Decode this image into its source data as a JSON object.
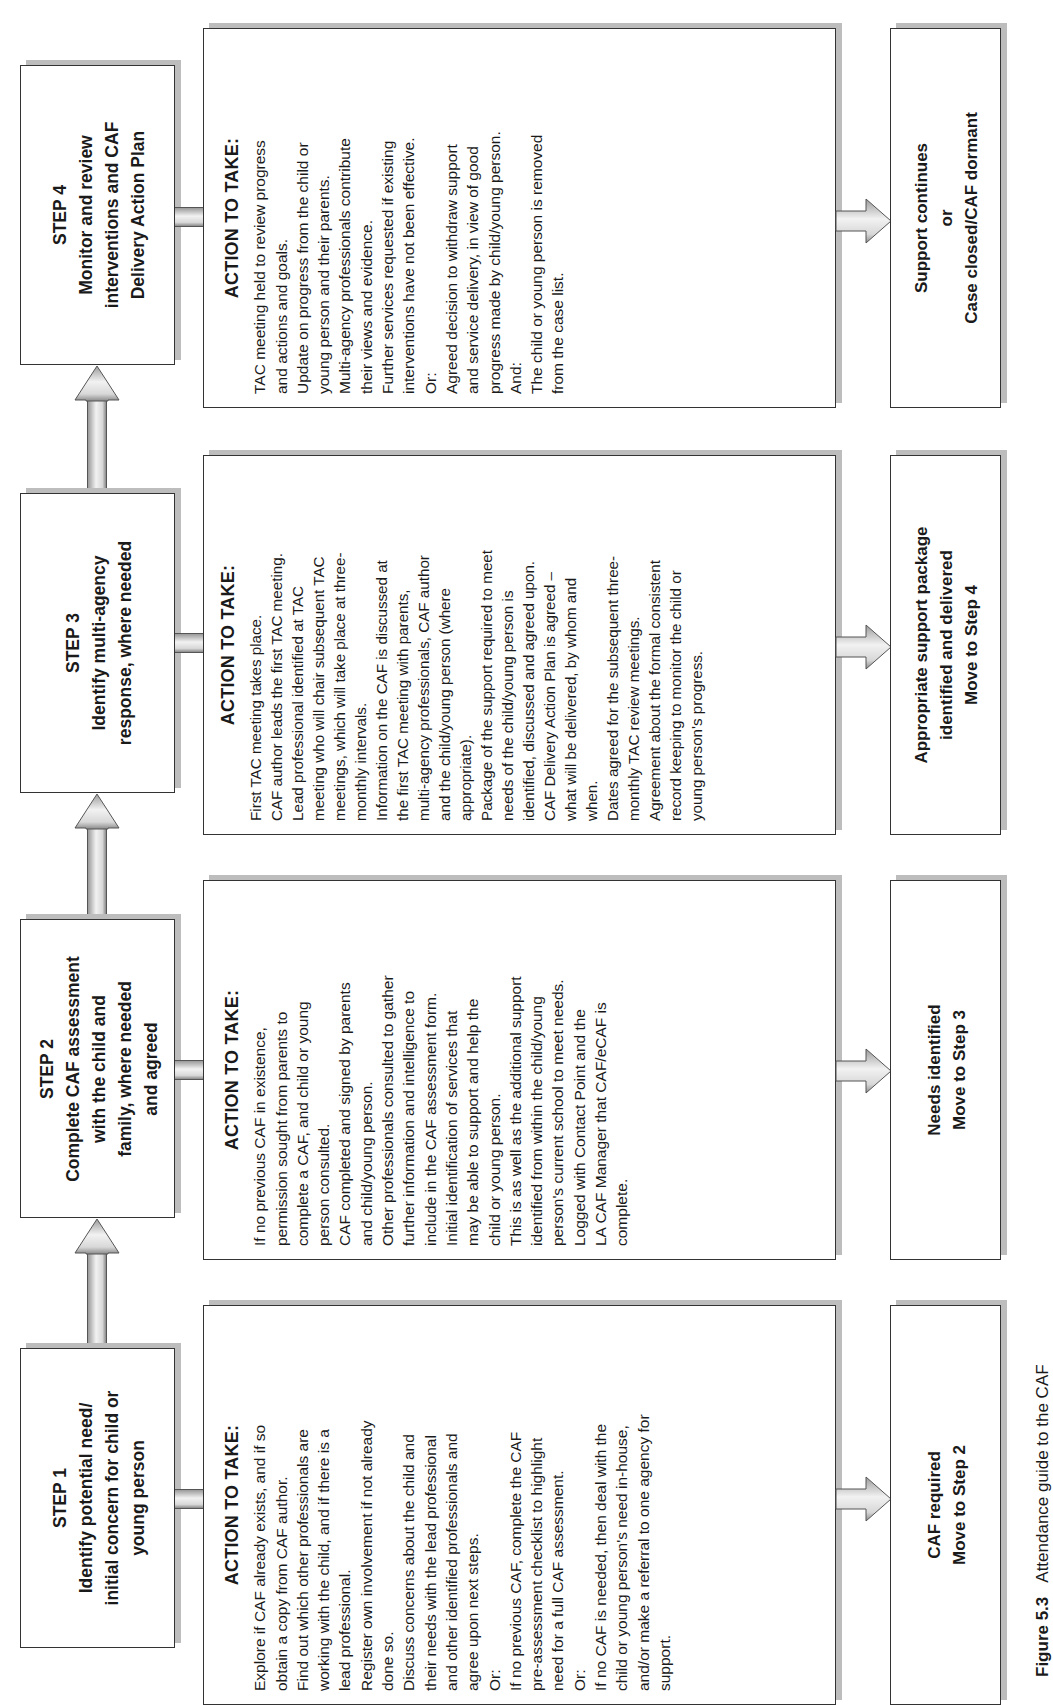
{
  "figure": {
    "caption_label": "Figure 5.3",
    "caption_text": "Attendance guide to the CAF"
  },
  "steps": [
    {
      "id": "step1",
      "title": "STEP 1",
      "lines": [
        "Identify potential need/",
        "initial concern for child or",
        "young person"
      ],
      "action_header": "ACTION TO TAKE:",
      "action_lines": [
        "Explore if CAF already exists,  and if so",
        "obtain a copy from CAF author.",
        "Find out which other professionals are",
        "working with the child,  and if there is a",
        "lead professional.",
        "Register own involvement if not already",
        "done so.",
        "Discuss concerns about the child and",
        "their needs with the lead professional",
        "and other identified professionals and",
        "agree upon next steps.",
        "Or:",
        "If no previous CAF, complete the CAF",
        "pre-assessment checklist to highlight",
        "need for a full CAF assessment.",
        "Or:",
        "If no CAF is needed, then deal with the",
        "child or young person's need in-house,",
        "and/or make a referral to one agency for",
        "support."
      ],
      "outcome_lines": [
        "CAF required",
        "Move to Step 2"
      ]
    },
    {
      "id": "step2",
      "title": "STEP 2",
      "lines": [
        "Complete CAF assessment",
        "with the child and",
        "family, where needed",
        "and agreed"
      ],
      "action_header": "ACTION TO TAKE:",
      "action_lines": [
        "If no previous CAF in existence,",
        "permission sought from parents to",
        "complete a CAF, and child or young",
        "person consulted.",
        "CAF completed and signed by parents",
        "and child/young person.",
        "Other professionals consulted to gather",
        "further information and intelligence to",
        "include in the CAF assessment form.",
        "Initial identification of services that",
        "may be able to support and help the",
        "child or young person.",
        "This is as well as the additional support",
        "identified from within the child/young",
        "person's current school to meet needs.",
        "Logged with Contact Point and the",
        "LA CAF Manager that CAF/eCAF is",
        "complete."
      ],
      "outcome_lines": [
        "Needs identified",
        "Move to Step 3"
      ]
    },
    {
      "id": "step3",
      "title": "STEP 3",
      "lines": [
        "Identify multi-agency",
        "response, where needed"
      ],
      "action_header": "ACTION TO TAKE:",
      "action_lines": [
        "First TAC meeting takes place.",
        "CAF author leads the first TAC meeting.",
        "Lead professional identified at TAC",
        "meeting who will chair subsequent TAC",
        "meetings, which will take place at three-",
        "monthly intervals.",
        "Information on the CAF is discussed at",
        "the first TAC meeting with parents,",
        "multi-agency professionals, CAF author",
        "and the child/young person (where",
        "appropriate).",
        "Package of the support required to meet",
        "needs of the child/young person is",
        "identified, discussed and agreed upon.",
        "CAF Delivery Action Plan is agreed –",
        "what will be delivered, by whom and",
        "when.",
        "Dates agreed for the subsequent three-",
        "monthly TAC review meetings.",
        "Agreement about the formal consistent",
        "record keeping to monitor the child or",
        "young person's progress."
      ],
      "outcome_lines": [
        "Appropriate support package",
        "identified and delivered",
        "Move to Step 4"
      ]
    },
    {
      "id": "step4",
      "title": "STEP 4",
      "lines": [
        "Monitor and review",
        "interventions and CAF",
        "Delivery Action Plan"
      ],
      "action_header": "ACTION TO TAKE:",
      "action_lines": [
        "TAC meeting held to review progress",
        "and actions and goals.",
        "Update on progress from the child or",
        "young person and their parents.",
        "Multi-agency professionals contribute",
        "their views and evidence.",
        "Further services requested if existing",
        "interventions have not been effective.",
        "Or:",
        "Agreed decision to withdraw support",
        "and service delivery, in view of good",
        "progress made by child/young person.",
        "And:",
        "The child or young person is removed",
        "from the case list."
      ],
      "outcome_lines": [
        "Support continues",
        "or",
        "Case closed/CAF dormant"
      ]
    }
  ]
}
